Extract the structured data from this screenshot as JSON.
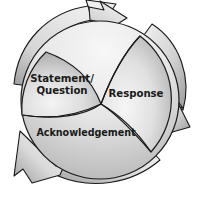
{
  "diagram": {
    "type": "three-stage-circular-cycle",
    "direction": "clockwise",
    "background_color": "#ffffff",
    "outline_color": "#1a1a1a",
    "segments": [
      {
        "id": "statement-question",
        "label_line1": "Statement/",
        "label_line2": "Question",
        "position": "upper-left",
        "fill_light": "#ececec",
        "fill_dark": "#a9a9a9"
      },
      {
        "id": "response",
        "label_line1": "Response",
        "label_line2": "",
        "position": "right",
        "fill_light": "#f0f0f0",
        "fill_dark": "#a2a2a2"
      },
      {
        "id": "acknowledgement",
        "label_line1": "Acknowledgement",
        "label_line2": "",
        "position": "bottom",
        "fill_light": "#f2f2f2",
        "fill_dark": "#b0b0b0"
      }
    ],
    "arrows": [
      {
        "id": "arrow-top",
        "points_to": "upper-right",
        "description": "curved arrow sweeping over the top toward the Response stage",
        "fill_light": "#e4e4e4",
        "fill_dark": "#9d9d9d"
      },
      {
        "id": "arrow-right",
        "points_to": "down",
        "description": "curved arrow sweeping down the right side toward the Acknowledgement stage",
        "fill_light": "#e4e4e4",
        "fill_dark": "#9d9d9d"
      },
      {
        "id": "arrow-bottom-left",
        "points_to": "upper-left",
        "description": "curved arrow sweeping under the bottom toward the Statement/Question stage",
        "fill_light": "#e8e8e8",
        "fill_dark": "#9d9d9d"
      }
    ]
  }
}
